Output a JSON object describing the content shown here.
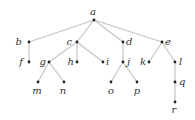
{
  "diagram": {
    "type": "tree",
    "root": "a",
    "nodes": [
      {
        "id": "a",
        "x": 94,
        "y": 20,
        "lx": 93,
        "ly": 15,
        "anchor": "middle"
      },
      {
        "id": "b",
        "x": 29,
        "y": 42,
        "lx": 22,
        "ly": 45,
        "anchor": "end"
      },
      {
        "id": "c",
        "x": 77,
        "y": 42,
        "lx": 72,
        "ly": 45,
        "anchor": "end"
      },
      {
        "id": "d",
        "x": 123,
        "y": 42,
        "lx": 126,
        "ly": 45,
        "anchor": "start"
      },
      {
        "id": "e",
        "x": 162,
        "y": 42,
        "lx": 165,
        "ly": 45,
        "anchor": "start"
      },
      {
        "id": "f",
        "x": 29,
        "y": 62,
        "lx": 23,
        "ly": 65,
        "anchor": "end"
      },
      {
        "id": "g",
        "x": 49,
        "y": 62,
        "lx": 46,
        "ly": 65,
        "anchor": "end"
      },
      {
        "id": "h",
        "x": 77,
        "y": 62,
        "lx": 74,
        "ly": 65,
        "anchor": "end"
      },
      {
        "id": "i",
        "x": 103,
        "y": 62,
        "lx": 106,
        "ly": 65,
        "anchor": "start"
      },
      {
        "id": "j",
        "x": 123,
        "y": 62,
        "lx": 127,
        "ly": 65,
        "anchor": "start"
      },
      {
        "id": "k",
        "x": 149,
        "y": 62,
        "lx": 146,
        "ly": 65,
        "anchor": "end"
      },
      {
        "id": "l",
        "x": 175,
        "y": 62,
        "lx": 179,
        "ly": 65,
        "anchor": "start"
      },
      {
        "id": "m",
        "x": 38,
        "y": 82,
        "lx": 37,
        "ly": 94,
        "anchor": "middle"
      },
      {
        "id": "n",
        "x": 64,
        "y": 82,
        "lx": 63,
        "ly": 94,
        "anchor": "middle"
      },
      {
        "id": "o",
        "x": 111,
        "y": 82,
        "lx": 111,
        "ly": 94,
        "anchor": "middle"
      },
      {
        "id": "p",
        "x": 137,
        "y": 82,
        "lx": 137,
        "ly": 94,
        "anchor": "middle"
      },
      {
        "id": "q",
        "x": 175,
        "y": 82,
        "lx": 179,
        "ly": 85,
        "anchor": "start"
      },
      {
        "id": "r",
        "x": 175,
        "y": 102,
        "lx": 174,
        "ly": 113,
        "anchor": "middle"
      }
    ],
    "edges": [
      [
        "a",
        "b"
      ],
      [
        "a",
        "c"
      ],
      [
        "a",
        "d"
      ],
      [
        "a",
        "e"
      ],
      [
        "b",
        "f"
      ],
      [
        "c",
        "g"
      ],
      [
        "c",
        "h"
      ],
      [
        "c",
        "i"
      ],
      [
        "d",
        "j"
      ],
      [
        "e",
        "k"
      ],
      [
        "e",
        "l"
      ],
      [
        "g",
        "m"
      ],
      [
        "g",
        "n"
      ],
      [
        "j",
        "o"
      ],
      [
        "j",
        "p"
      ],
      [
        "l",
        "q"
      ],
      [
        "q",
        "r"
      ]
    ],
    "colors": {
      "edge": "#c4c4c4",
      "node": "#222222",
      "label": "#333333"
    }
  }
}
